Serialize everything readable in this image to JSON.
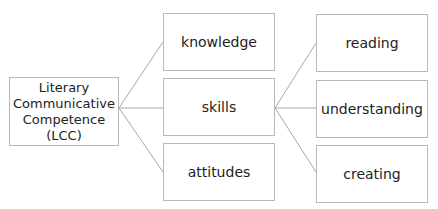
{
  "diagram": {
    "root": {
      "label": "Literary Communicative Competence (LCC)",
      "lines": [
        "Literary",
        "Communicative",
        "Competence (LCC)"
      ]
    },
    "level1": [
      {
        "label": "knowledge"
      },
      {
        "label": "skills"
      },
      {
        "label": "attitudes"
      }
    ],
    "level2_parent": "skills",
    "level2": [
      {
        "label": "reading"
      },
      {
        "label": "understanding"
      },
      {
        "label": "creating"
      }
    ],
    "colors": {
      "border": "#b8b8b8",
      "line": "#a8a8a8",
      "text": "#222222"
    }
  }
}
